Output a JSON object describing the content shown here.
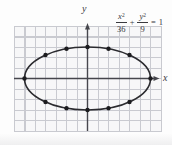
{
  "labels": {
    "x_axis": "x",
    "y_axis": "y"
  },
  "equation": {
    "term1": {
      "numerator_var": "x",
      "numerator_exp": "2",
      "denominator": "36"
    },
    "operator": "+",
    "term2": {
      "numerator_var": "y",
      "numerator_exp": "2",
      "denominator": "9"
    },
    "equals": "=",
    "rhs": "1"
  },
  "colors": {
    "curve": "#2b2b2f",
    "axis": "#46464c",
    "grid_line": "#c9cad0",
    "grid_bg": "#f7f7f8",
    "point": "#1c1c1f",
    "text": "#3a3a3f"
  },
  "chart_data": {
    "type": "scatter",
    "curve": "ellipse",
    "center": [
      0,
      0
    ],
    "semi_axis_a_x": 6,
    "semi_axis_b_y": 3,
    "points": [
      [
        -6,
        0
      ],
      [
        -4,
        2.24
      ],
      [
        -2,
        2.83
      ],
      [
        0,
        3
      ],
      [
        2,
        2.83
      ],
      [
        4,
        2.24
      ],
      [
        6,
        0
      ],
      [
        4,
        -2.24
      ],
      [
        2,
        -2.83
      ],
      [
        0,
        -3
      ],
      [
        -2,
        -2.83
      ],
      [
        -4,
        -2.24
      ]
    ],
    "xlabel": "x",
    "ylabel": "y",
    "xlim": [
      -7,
      7
    ],
    "ylim": [
      -5,
      5
    ],
    "grid": true,
    "grid_step": 1
  }
}
